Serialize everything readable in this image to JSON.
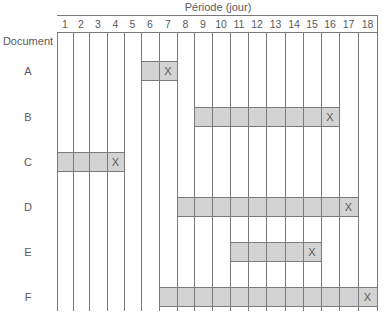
{
  "chart_data": {
    "type": "gantt",
    "title": "Période (jour)",
    "xlabel": "Période (jour)",
    "ylabel": "Document",
    "periods": [
      1,
      2,
      3,
      4,
      5,
      6,
      7,
      8,
      9,
      10,
      11,
      12,
      13,
      14,
      15,
      16,
      17,
      18
    ],
    "tasks": [
      {
        "name": "A",
        "start": 6,
        "end": 7,
        "marker_period": 7,
        "marker": "X"
      },
      {
        "name": "B",
        "start": 9,
        "end": 16,
        "marker_period": 16,
        "marker": "X"
      },
      {
        "name": "C",
        "start": 1,
        "end": 4,
        "marker_period": 4,
        "marker": "X"
      },
      {
        "name": "D",
        "start": 8,
        "end": 17,
        "marker_period": 17,
        "marker": "X"
      },
      {
        "name": "E",
        "start": 11,
        "end": 15,
        "marker_period": 15,
        "marker": "X"
      },
      {
        "name": "F",
        "start": 7,
        "end": 18,
        "marker_period": 18,
        "marker": "X"
      }
    ],
    "grid": true,
    "bar_color": "#d3d3d3",
    "line_color": "#7a7a7a"
  },
  "labels": {
    "axis_title": "Période (jour)",
    "row_header": "Document"
  }
}
